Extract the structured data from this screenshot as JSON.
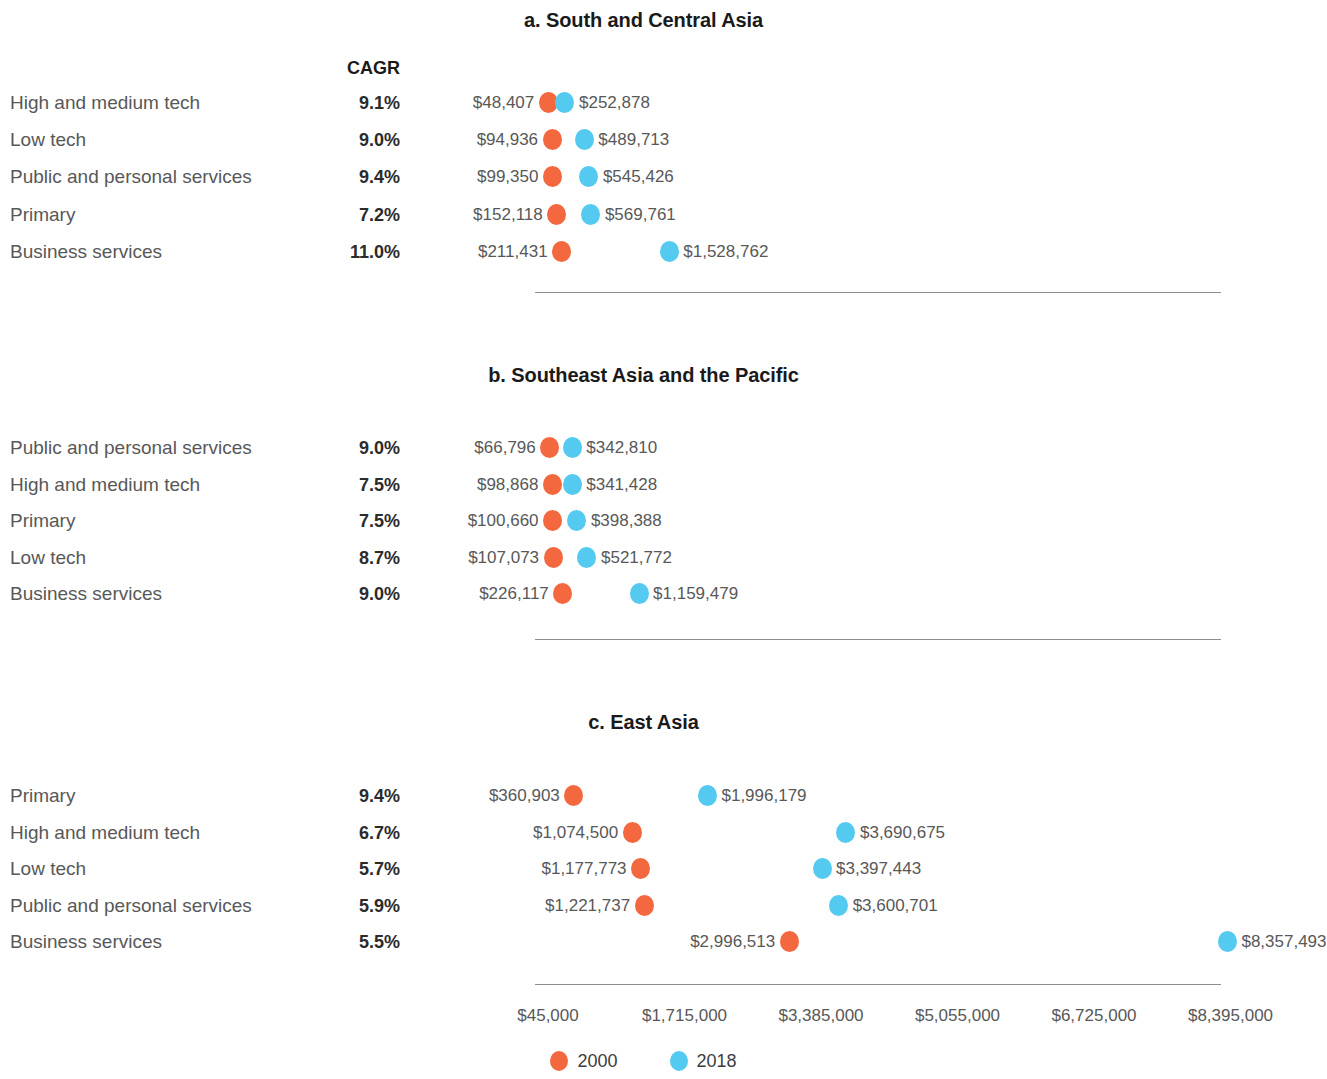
{
  "colors": {
    "series_2000": "#f4683f",
    "series_2018": "#54caf0",
    "label_text": "#585858",
    "axis_line": "#8d8d8d"
  },
  "cagr_header": "CAGR",
  "legend": {
    "items": [
      {
        "label": "2000",
        "color": "#f4683f"
      },
      {
        "label": "2018",
        "color": "#54caf0"
      }
    ]
  },
  "axis": {
    "ticks": [
      "$45,000",
      "$1,715,000",
      "$3,385,000",
      "$5,055,000",
      "$6,725,000",
      "$8,395,000"
    ],
    "tick_values": [
      45000,
      1715000,
      3385000,
      5055000,
      6725000,
      8395000
    ],
    "min": 45000,
    "max": 8395000
  },
  "chart_data": {
    "type": "scatter",
    "xlabel": "",
    "ylabel": "",
    "xlim": [
      45000,
      8395000
    ],
    "grid": false,
    "legend_position": "bottom-center",
    "xtick_labels": [
      "$45,000",
      "$1,715,000",
      "$3,385,000",
      "$5,055,000",
      "$6,725,000",
      "$8,395,000"
    ],
    "series": [
      {
        "name": "2000",
        "color": "#f4683f"
      },
      {
        "name": "2018",
        "color": "#54caf0"
      }
    ],
    "panels": [
      {
        "id": "a",
        "title": "a. South and Central Asia",
        "rows": [
          {
            "category": "High and medium tech",
            "cagr": "9.1%",
            "v2000": 48407,
            "v2018": 252878,
            "v2000_label": "$48,407",
            "v2018_label": "$252,878"
          },
          {
            "category": "Low tech",
            "cagr": "9.0%",
            "v2000": 94936,
            "v2018": 489713,
            "v2000_label": "$94,936",
            "v2018_label": "$489,713"
          },
          {
            "category": "Public and personal services",
            "cagr": "9.4%",
            "v2000": 99350,
            "v2018": 545426,
            "v2000_label": "$99,350",
            "v2018_label": "$545,426"
          },
          {
            "category": "Primary",
            "cagr": "7.2%",
            "v2000": 152118,
            "v2018": 569761,
            "v2000_label": "$152,118",
            "v2018_label": "$569,761"
          },
          {
            "category": "Business services",
            "cagr": "11.0%",
            "v2000": 211431,
            "v2018": 1528762,
            "v2000_label": "$211,431",
            "v2018_label": "$1,528,762"
          }
        ]
      },
      {
        "id": "b",
        "title": "b. Southeast Asia and the Pacific",
        "rows": [
          {
            "category": "Public and personal services",
            "cagr": "9.0%",
            "v2000": 66796,
            "v2018": 342810,
            "v2000_label": "$66,796",
            "v2018_label": "$342,810"
          },
          {
            "category": "High and medium tech",
            "cagr": "7.5%",
            "v2000": 98868,
            "v2018": 341428,
            "v2000_label": "$98,868",
            "v2018_label": "$341,428"
          },
          {
            "category": "Primary",
            "cagr": "7.5%",
            "v2000": 100660,
            "v2018": 398388,
            "v2000_label": "$100,660",
            "v2018_label": "$398,388"
          },
          {
            "category": "Low tech",
            "cagr": "8.7%",
            "v2000": 107073,
            "v2018": 521772,
            "v2000_label": "$107,073",
            "v2018_label": "$521,772"
          },
          {
            "category": "Business services",
            "cagr": "9.0%",
            "v2000": 226117,
            "v2018": 1159479,
            "v2000_label": "$226,117",
            "v2018_label": "$1,159,479"
          }
        ]
      },
      {
        "id": "c",
        "title": "c. East Asia",
        "rows": [
          {
            "category": "Primary",
            "cagr": "9.4%",
            "v2000": 360903,
            "v2018": 1996179,
            "v2000_label": "$360,903",
            "v2018_label": "$1,996,179"
          },
          {
            "category": "High and medium tech",
            "cagr": "6.7%",
            "v2000": 1074500,
            "v2018": 3690675,
            "v2000_label": "$1,074,500",
            "v2018_label": "$3,690,675"
          },
          {
            "category": "Low tech",
            "cagr": "5.7%",
            "v2000": 1177773,
            "v2018": 3397443,
            "v2000_label": "$1,177,773",
            "v2018_label": "$3,397,443"
          },
          {
            "category": "Public and personal services",
            "cagr": "5.9%",
            "v2000": 1221737,
            "v2018": 3600701,
            "v2000_label": "$1,221,737",
            "v2018_label": "$3,600,701"
          },
          {
            "category": "Business services",
            "cagr": "5.5%",
            "v2000": 2996513,
            "v2018": 8357493,
            "v2000_label": "$2,996,513",
            "v2018_label": "$8,357,493"
          }
        ]
      }
    ]
  }
}
